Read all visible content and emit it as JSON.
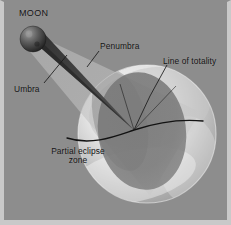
{
  "figure": {
    "type": "astronomy-diagram",
    "width": 231,
    "height": 225,
    "background_color": "#8d8d8d",
    "frame_color": "#c9c9c9"
  },
  "labels": {
    "moon": "MOON",
    "penumbra": "Penumbra",
    "line_of_totality": "Line of totality",
    "umbra": "Umbra",
    "partial_eclipse_zone": "Partial eclipse\nzone",
    "partial_eclipse_zone_line1": "Partial eclipse",
    "partial_eclipse_zone_line2": "zone"
  },
  "objects": {
    "moon": {
      "name": "moon-sphere",
      "center_x": 33,
      "center_y": 39,
      "radius": 13,
      "color_light": "#8f8f8f",
      "color_dark": "#232323"
    },
    "earth": {
      "name": "earth-sphere",
      "center_x": 147,
      "center_y": 134,
      "radius": 69,
      "color_light": "#f2f2f2",
      "color_mid": "#b6b6b6",
      "color_dark": "#8a8a8a"
    },
    "penumbra_cone": {
      "name": "penumbra-cone",
      "color": "#c2c2c2",
      "opacity": 0.62
    },
    "umbra_cone": {
      "name": "umbra-cone",
      "color": "#3b3b3b",
      "opacity": 0.9
    },
    "penumbra_shadow_on_earth": {
      "name": "penumbra-shadow-ellipse",
      "color": "#6e6e6e",
      "opacity": 0.72
    },
    "line_of_totality": {
      "name": "line-of-totality-curve",
      "color": "#141414",
      "stroke_width": 1.3
    }
  },
  "leader_lines": {
    "penumbra": {
      "color": "#1c1c1c",
      "from_x": 99,
      "from_y": 50,
      "to_x": 88,
      "to_y": 66
    },
    "umbra": {
      "color": "#1c1c1c",
      "from_x": 43,
      "from_y": 83,
      "to_x": 66,
      "to_y": 56
    },
    "line_of_totality": {
      "color": "#1c1c1c",
      "from_x": 166,
      "from_y": 64,
      "to_x": 134,
      "to_y": 130
    }
  }
}
